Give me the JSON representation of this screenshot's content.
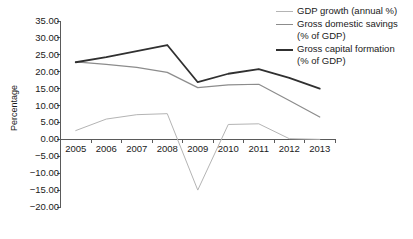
{
  "chart_data": {
    "type": "line",
    "title": "",
    "xlabel": "",
    "ylabel": "Percentage",
    "categories": [
      "2005",
      "2006",
      "2007",
      "2008",
      "2009",
      "2010",
      "2011",
      "2012",
      "2013"
    ],
    "x": [
      2005,
      2006,
      2007,
      2008,
      2009,
      2010,
      2011,
      2012,
      2013
    ],
    "ylim": [
      -20.0,
      35.0
    ],
    "ytick_values": [
      35.0,
      30.0,
      25.0,
      20.0,
      15.0,
      10.0,
      5.0,
      0.0,
      -5.0,
      -10.0,
      -15.0,
      -20.0
    ],
    "ytick_labels": [
      "35.00",
      "30.00",
      "25.00",
      "20.00",
      "15.00",
      "10.00",
      "5.00",
      "0.00",
      "-5.00",
      "-10.00",
      "-15.00",
      "-20.00"
    ],
    "grid": false,
    "legend_position": "top-right",
    "series": [
      {
        "name": "GDP growth (annual %)",
        "color": "#b4b4b4",
        "width": 1.0,
        "values": [
          2.6,
          6.0,
          7.3,
          7.6,
          -15.0,
          4.4,
          4.6,
          0.2,
          0.0
        ]
      },
      {
        "name": "Gross domestic savings\n(% of GDP)",
        "color": "#8c8c8c",
        "width": 1.2,
        "values": [
          22.9,
          22.2,
          21.3,
          19.8,
          15.3,
          16.1,
          16.3,
          11.5,
          6.6
        ]
      },
      {
        "name": "Gross capital formation\n(% of GDP)",
        "color": "#303030",
        "width": 1.8,
        "values": [
          22.8,
          24.3,
          26.1,
          27.9,
          16.9,
          19.4,
          20.8,
          18.2,
          15.0
        ]
      }
    ]
  },
  "legend": {
    "items": [
      {
        "label": "GDP growth (annual %)"
      },
      {
        "label": "Gross domestic savings\n(% of GDP)"
      },
      {
        "label": "Gross capital formation\n(% of GDP)"
      }
    ]
  },
  "axes": {
    "y_title": "Percentage"
  }
}
